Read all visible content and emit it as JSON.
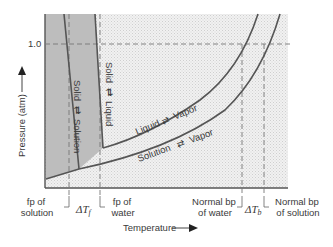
{
  "diagram": {
    "y_axis": {
      "label": "Pressure (atm)",
      "tick": "1.0"
    },
    "x_axis": {
      "label": "Temperature"
    },
    "regions": {
      "solid_solution": "Solid ⇄ Solution",
      "solid_liquid": "Solid ⇄ Liquid",
      "liquid_vapor": "Liquid ⇄ Vapor",
      "solution_vapor": "Solution ⇄ Vapor"
    },
    "region_labels": {
      "ss_a": "Solid",
      "ss_b": "Solution",
      "sl_a": "Solid",
      "sl_b": "Liquid",
      "lv_a": "Liquid",
      "lv_b": "Vapor",
      "sv_a": "Solution",
      "sv_b": "Vapor"
    },
    "markers": {
      "fp_solution_1": "fp of",
      "fp_solution_2": "solution",
      "delta_tf": "ΔT",
      "delta_tf_sub": "f",
      "fp_water_1": "fp of",
      "fp_water_2": "water",
      "bp_water_1": "Normal bp",
      "bp_water_2": "of water",
      "delta_tb": "ΔT",
      "delta_tb_sub": "b",
      "bp_solution_1": "Normal bp",
      "bp_solution_2": "of solution"
    },
    "colors": {
      "solid_fill": "#bdbdbd",
      "stipple": "#e9e9e9",
      "line": "#555555"
    }
  }
}
